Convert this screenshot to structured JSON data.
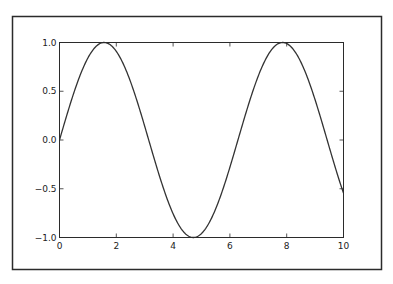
{
  "chart_data": {
    "type": "line",
    "title": "",
    "xlabel": "",
    "ylabel": "",
    "xlim": [
      0,
      10
    ],
    "ylim": [
      -1.0,
      1.0
    ],
    "grid": false,
    "legend": null,
    "x_ticks": [
      0,
      2,
      4,
      6,
      8,
      10
    ],
    "x_tick_labels": [
      "0",
      "2",
      "4",
      "6",
      "8",
      "10"
    ],
    "y_ticks": [
      -1.0,
      -0.5,
      0.0,
      0.5,
      1.0
    ],
    "y_tick_labels": [
      "−1.0",
      "−0.5",
      "0.0",
      "0.5",
      "1.0"
    ],
    "series": [
      {
        "name": "sin(x)",
        "function": "sin",
        "color": "#333333",
        "x": [
          0,
          0.5,
          1,
          1.5,
          2,
          2.5,
          3,
          3.5,
          4,
          4.5,
          5,
          5.5,
          6,
          6.5,
          7,
          7.5,
          8,
          8.5,
          9,
          9.5,
          10
        ],
        "y": [
          0.0,
          0.479,
          0.841,
          0.997,
          0.909,
          0.598,
          0.141,
          -0.351,
          -0.757,
          -0.978,
          -0.959,
          -0.706,
          -0.279,
          0.215,
          0.657,
          0.938,
          0.989,
          0.798,
          0.412,
          -0.075,
          -0.544
        ]
      }
    ]
  },
  "colors": {
    "frame": "#2b2b2b",
    "axes": "#2b2b2b",
    "line": "#333333",
    "background": "#ffffff"
  }
}
